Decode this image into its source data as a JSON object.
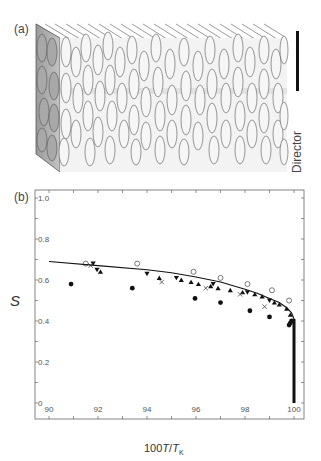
{
  "figure": {
    "panel_a": {
      "label": "(a)",
      "director_label": "Director",
      "description": "Schematic of nematic/columnar ordering of ellipsoidal particles aligned along the director"
    },
    "panel_b": {
      "label": "(b)",
      "ylabel": "S",
      "xlabel_prefix": "100",
      "xlabel_T": "T",
      "xlabel_slash": "/",
      "xlabel_TK": "T",
      "xlabel_sub": "K"
    }
  },
  "chart_data": {
    "type": "scatter",
    "title": "",
    "xlabel": "100T/T_K",
    "ylabel": "S",
    "xlim": [
      89.5,
      100.7
    ],
    "ylim": [
      -0.03,
      1.05
    ],
    "xticks": [
      90,
      92,
      94,
      96,
      98,
      100
    ],
    "xtick_labels": [
      "90",
      "92",
      "94",
      "96",
      "98",
      "100"
    ],
    "yticks": [
      0,
      0.2,
      0.4,
      0.6,
      0.8,
      1.0
    ],
    "ytick_labels": [
      "0",
      "0.2",
      "0.4",
      "0.6",
      "0.8",
      "1.0"
    ],
    "grid": false,
    "legend": null,
    "series": [
      {
        "name": "filled circles",
        "marker": "filled-circle",
        "x": [
          90.9,
          93.4,
          95.96,
          97.0,
          98.2,
          99.0,
          99.8,
          99.85,
          99.9
        ],
        "y": [
          0.58,
          0.56,
          0.51,
          0.49,
          0.45,
          0.42,
          0.38,
          0.39,
          0.4
        ]
      },
      {
        "name": "open circles",
        "marker": "open-circle",
        "x": [
          91.5,
          93.6,
          95.9,
          97.0,
          98.1,
          99.1,
          99.8
        ],
        "y": [
          0.68,
          0.68,
          0.64,
          0.61,
          0.58,
          0.55,
          0.5
        ]
      },
      {
        "name": "down triangles",
        "marker": "filled-triangle-down",
        "x": [
          91.8,
          91.96,
          94.0,
          95.2,
          96.7,
          98.1,
          99.0
        ],
        "y": [
          0.68,
          0.65,
          0.63,
          0.61,
          0.58,
          0.54,
          0.5
        ]
      },
      {
        "name": "up triangles",
        "marker": "filled-triangle-up",
        "x": [
          92.1,
          94.5,
          95.4,
          95.8,
          96.1,
          96.6,
          96.9,
          97.4,
          97.9,
          98.4,
          98.7,
          99.2,
          99.4,
          99.7,
          99.85
        ],
        "y": [
          0.64,
          0.61,
          0.6,
          0.59,
          0.58,
          0.57,
          0.56,
          0.55,
          0.54,
          0.53,
          0.52,
          0.49,
          0.48,
          0.46,
          0.43
        ]
      },
      {
        "name": "crosses",
        "marker": "cross",
        "x": [
          91.7,
          94.6,
          96.4,
          97.8,
          98.8
        ],
        "y": [
          0.67,
          0.59,
          0.56,
          0.53,
          0.47
        ]
      },
      {
        "name": "fit curve",
        "marker": "line",
        "x": [
          90,
          92,
          94,
          95,
          96,
          97,
          98,
          98.5,
          99,
          99.4,
          99.7,
          99.9,
          100,
          100
        ],
        "y": [
          0.69,
          0.67,
          0.65,
          0.635,
          0.615,
          0.59,
          0.555,
          0.535,
          0.51,
          0.49,
          0.465,
          0.44,
          0.41,
          0.0
        ]
      }
    ]
  }
}
